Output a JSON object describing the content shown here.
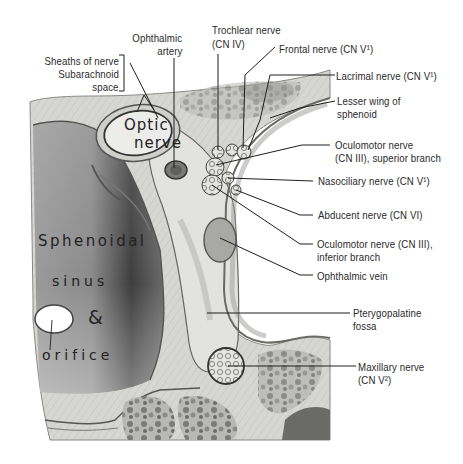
{
  "figure": {
    "palette": {
      "background": "#ffffff",
      "bone_light": "#dcdcd8",
      "bone_mid": "#c8c8c4",
      "sinus_dark": "#4a4a4a",
      "line": "#1e1e1e",
      "text": "#2a2a2a"
    }
  },
  "labels": {
    "sheaths": {
      "line1": "Sheaths of nerve",
      "line2": "Subarachnoid",
      "line3": "space"
    },
    "ophthalmic_artery": {
      "line1": "Ophthalmic",
      "line2": "artery"
    },
    "trochlear": {
      "line1": "Trochlear nerve",
      "line2": "(CN IV)"
    },
    "frontal": {
      "text": "Frontal nerve (CN V¹)"
    },
    "lacrimal": {
      "text": "Lacrimal nerve (CN V¹)"
    },
    "lesser_wing": {
      "line1": "Lesser wing of",
      "line2": "sphenoid"
    },
    "oculomotor_sup": {
      "line1": "Oculomotor nerve",
      "line2": "(CN III), superior branch"
    },
    "nasociliary": {
      "text": "Nasociliary nerve (CN V¹)"
    },
    "abducent": {
      "text": "Abducent nerve (CN VI)"
    },
    "oculomotor_inf": {
      "line1": "Oculomotor nerve (CN III),",
      "line2": "inferior branch"
    },
    "ophthalmic_vein": {
      "text": "Ophthalmic vein"
    },
    "pterygopalatine": {
      "line1": "Pterygopalatine",
      "line2": "fossa"
    },
    "maxillary": {
      "line1": "Maxillary nerve",
      "line2": "(CN V²)"
    }
  },
  "handwritten": {
    "optic_nerve": {
      "line1": "Optic",
      "line2": "nerve"
    },
    "sphenoidal": "Sphenoidal",
    "sinus": "sinus",
    "ampersand": "&",
    "orifice": "orifice"
  }
}
